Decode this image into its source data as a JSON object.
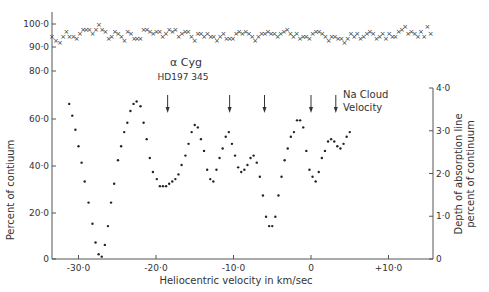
{
  "chart_data": {
    "type": "scatter",
    "title": "α Cyg",
    "subtitle": "HD197 345",
    "xlabel": "Heliocentric velocity in km/sec",
    "ylabel": "Percent of contiuum",
    "ylabel_right": [
      "Depth of absorption line",
      "percent of continuum"
    ],
    "xlim": [
      -34,
      15
    ],
    "ylim": [
      0,
      100
    ],
    "ylim_right": [
      0,
      4.0
    ],
    "x_ticks": [
      "-30·0",
      "-20·0",
      "-10·0",
      "0",
      "+10·0"
    ],
    "x_tick_values": [
      -30,
      -20,
      -10,
      0,
      10
    ],
    "y_ticks_left": [
      "0",
      "20·0",
      "40·0",
      "60·0",
      "80·0",
      "90·0",
      "100·0"
    ],
    "y_tick_values_left": [
      0,
      20,
      40,
      60,
      80,
      90,
      100
    ],
    "y_ticks_right": [
      "0",
      "1·0",
      "2·0",
      "3·0",
      "4·0"
    ],
    "y_tick_values_right": [
      0,
      1.0,
      2.0,
      3.0,
      4.0
    ],
    "grid": false,
    "legend": null,
    "annotations": {
      "arrows_x": [
        -18.5,
        -10.5,
        -6.0,
        0.0,
        3.2
      ],
      "arrow_label": [
        "Na Cloud",
        "Velocity"
      ]
    },
    "series": [
      {
        "name": "Continuum (top, × markers)",
        "marker": "x",
        "x": [
          -34.0,
          -33.5,
          -33.0,
          -32.6,
          -32.2,
          -31.8,
          -31.3,
          -30.9,
          -30.5,
          -30.1,
          -29.7,
          -29.3,
          -28.9,
          -28.5,
          -28.1,
          -27.7,
          -27.3,
          -26.9,
          -26.5,
          -26.1,
          -25.7,
          -25.3,
          -24.9,
          -24.5,
          -24.1,
          -23.7,
          -23.3,
          -22.9,
          -22.5,
          -22.1,
          -21.7,
          -21.3,
          -20.9,
          -20.5,
          -20.1,
          -19.7,
          -19.3,
          -18.9,
          -18.5,
          -18.1,
          -17.7,
          -17.3,
          -16.9,
          -16.5,
          -16.1,
          -15.7,
          -15.3,
          -14.9,
          -14.5,
          -14.1,
          -13.7,
          -13.3,
          -12.9,
          -12.5,
          -12.1,
          -11.7,
          -11.3,
          -10.9,
          -10.5,
          -10.1,
          -9.7,
          -9.3,
          -8.9,
          -8.5,
          -8.1,
          -7.7,
          -7.3,
          -6.9,
          -6.5,
          -6.1,
          -5.7,
          -5.3,
          -4.9,
          -4.5,
          -4.1,
          -3.7,
          -3.3,
          -2.9,
          -2.5,
          -2.1,
          -1.7,
          -1.3,
          -0.9,
          -0.5,
          -0.1,
          0.3,
          0.7,
          1.1,
          1.5,
          1.9,
          2.3,
          2.7,
          3.1,
          3.5,
          3.9,
          4.3,
          4.7,
          5.1,
          5.5,
          5.9,
          6.3,
          6.7,
          7.1,
          7.5,
          7.9,
          8.3,
          8.7,
          9.1,
          9.5,
          9.9,
          10.3,
          10.7,
          11.1,
          11.5,
          11.9,
          12.3,
          12.7,
          13.1,
          13.5
        ],
        "y": [
          95,
          93,
          92,
          95,
          97,
          95,
          95,
          94,
          96,
          98,
          98,
          98,
          96,
          98,
          100,
          98,
          97,
          94,
          95,
          97,
          96,
          95,
          93,
          97,
          96,
          94,
          94,
          94,
          98,
          98,
          97,
          96,
          97,
          97,
          95,
          96,
          98,
          97,
          98,
          95,
          96,
          97,
          97,
          95,
          93,
          96,
          96,
          95,
          96,
          95,
          95,
          93,
          95,
          96,
          94,
          94,
          94,
          96,
          97,
          96,
          97,
          96,
          95,
          93,
          95,
          96,
          96,
          97,
          96,
          96,
          95,
          96,
          97,
          98,
          96,
          95,
          96,
          94,
          95,
          95,
          94,
          96,
          97,
          97,
          96,
          95,
          93,
          95,
          95,
          94,
          94,
          92,
          94,
          96,
          95,
          96,
          94,
          95,
          96,
          97,
          96,
          94,
          95,
          96,
          94,
          96,
          95,
          95,
          97,
          98,
          99,
          96,
          97,
          96,
          95,
          97,
          95,
          99,
          96
        ],
        "note": "Values approximate; top trace ~92–100% with scatter"
      },
      {
        "name": "Absorption line depth (bottom, • markers)",
        "marker": "dot",
        "x": [
          -31.2,
          -30.8,
          -30.4,
          -30.0,
          -29.6,
          -29.2,
          -28.7,
          -28.2,
          -27.8,
          -27.4,
          -27.0,
          -26.6,
          -26.2,
          -25.8,
          -25.4,
          -24.9,
          -24.5,
          -24.1,
          -23.7,
          -23.3,
          -22.9,
          -22.5,
          -22.0,
          -21.6,
          -21.2,
          -20.8,
          -20.4,
          -19.9,
          -19.5,
          -19.1,
          -18.7,
          -18.3,
          -17.9,
          -17.5,
          -17.1,
          -16.7,
          -16.2,
          -15.8,
          -15.4,
          -15.0,
          -14.6,
          -14.2,
          -13.8,
          -13.4,
          -13.0,
          -12.6,
          -12.2,
          -11.8,
          -11.4,
          -11.0,
          -10.6,
          -10.2,
          -9.8,
          -9.4,
          -9.0,
          -8.6,
          -8.2,
          -7.8,
          -7.4,
          -7.0,
          -6.6,
          -6.2,
          -5.8,
          -5.4,
          -5.0,
          -4.6,
          -4.2,
          -3.8,
          -3.4,
          -3.0,
          -2.6,
          -2.2,
          -1.8,
          -1.4,
          -1.0,
          -0.6,
          -0.2,
          0.2,
          0.6,
          1.0,
          1.4,
          1.8,
          2.2,
          2.6,
          3.0,
          3.4,
          3.8,
          4.2,
          4.6,
          5.0
        ],
        "y": [
          66,
          61,
          55,
          48,
          41,
          33,
          24,
          15,
          7,
          2,
          1,
          6,
          14,
          24,
          32,
          42,
          48,
          54,
          58,
          63,
          66,
          67,
          65,
          58,
          51,
          43,
          37,
          34,
          31,
          31,
          31,
          32,
          33,
          34,
          36,
          40,
          44,
          49,
          54,
          57,
          56,
          51,
          46,
          38,
          34,
          33,
          38,
          43,
          47,
          52,
          54,
          49,
          44,
          39,
          37,
          38,
          40,
          43,
          44,
          41,
          35,
          27,
          18,
          14,
          14,
          18,
          27,
          35,
          42,
          47,
          52,
          54,
          59,
          59,
          56,
          46,
          38,
          35,
          33,
          37,
          43,
          46,
          50,
          51,
          50,
          48,
          47,
          49,
          52,
          54
        ]
      }
    ]
  }
}
